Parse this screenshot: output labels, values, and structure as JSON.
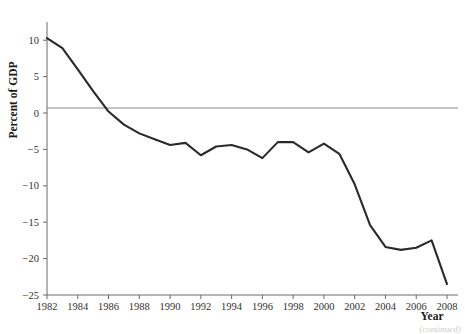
{
  "figure": {
    "footer_note": "(continued)"
  },
  "chart_data": {
    "type": "line",
    "title": "",
    "xlabel": "Year",
    "ylabel": "Percent of GDP",
    "xlim": [
      1982,
      2008
    ],
    "ylim": [
      -25,
      12.5
    ],
    "grid": false,
    "legend": "none",
    "zero_reference_line": true,
    "ytick_labels": [
      "10",
      "5",
      "0",
      "−5",
      "−10",
      "−15",
      "−20",
      "−25"
    ],
    "ytick_values": [
      10,
      5,
      0,
      -5,
      -10,
      -15,
      -20,
      -25
    ],
    "xtick_labels": [
      "1982",
      "1984",
      "1986",
      "1988",
      "1990",
      "1992",
      "1994",
      "1996",
      "1998",
      "2000",
      "2002",
      "2004",
      "2006",
      "2008"
    ],
    "xtick_values": [
      1982,
      1984,
      1986,
      1988,
      1990,
      1992,
      1994,
      1996,
      1998,
      2000,
      2002,
      2004,
      2006,
      2008
    ],
    "series": [
      {
        "name": "Percent of GDP",
        "color": "#2b2a28",
        "x": [
          1982,
          1983,
          1984,
          1985,
          1986,
          1987,
          1988,
          1989,
          1990,
          1991,
          1992,
          1993,
          1994,
          1995,
          1996,
          1997,
          1998,
          1999,
          2000,
          2001,
          2002,
          2003,
          2004,
          2005,
          2006,
          2007,
          2008
        ],
        "values": [
          10.3,
          8.9,
          6.0,
          3.0,
          0.2,
          -1.6,
          -2.8,
          -3.6,
          -4.4,
          -4.1,
          -5.8,
          -4.6,
          -4.4,
          -5.0,
          -6.2,
          -4.0,
          -4.0,
          -5.4,
          -4.2,
          -5.6,
          -9.8,
          -15.4,
          -18.4,
          -18.8,
          -18.5,
          -17.5,
          -23.5
        ]
      }
    ]
  }
}
